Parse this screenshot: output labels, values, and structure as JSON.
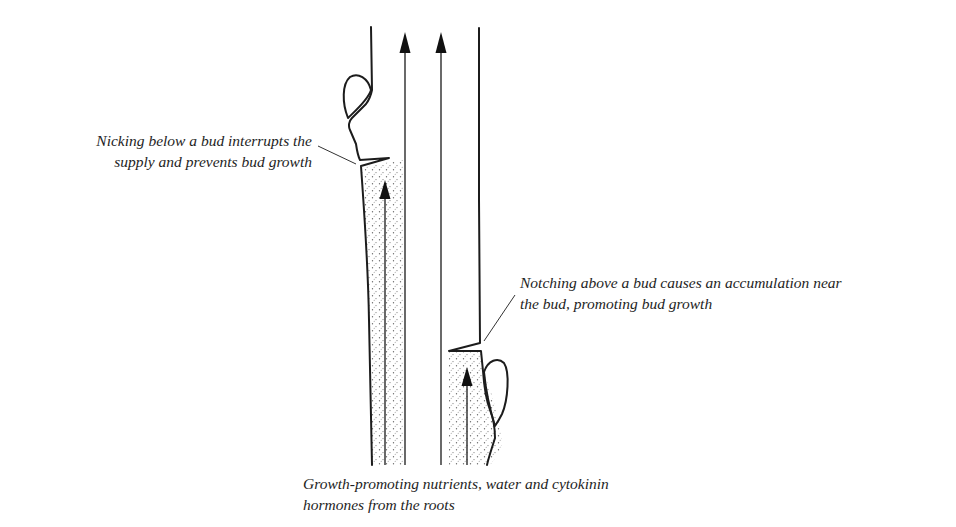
{
  "diagram": {
    "type": "botanical-illustration",
    "colors": {
      "ink": "#1c1c1c",
      "stipple": "#555555",
      "background": "#ffffff"
    },
    "labels": {
      "nicking": {
        "line1": "Nicking below a bud interrupts the",
        "line2": "supply and prevents bud growth"
      },
      "notching": {
        "line1": "Notching above a bud causes an accumulation near",
        "line2": "the bud, promoting bud growth"
      },
      "roots": {
        "line1": "Growth-promoting nutrients, water and cytokinin",
        "line2": "hormones from the roots"
      }
    },
    "elements": [
      {
        "name": "upper-bud",
        "side": "left",
        "state": "suppressed (above nick)"
      },
      {
        "name": "lower-bud",
        "side": "right",
        "state": "promoted (below notch)"
      },
      {
        "name": "nick-cut",
        "position": "below upper bud"
      },
      {
        "name": "notch-cut",
        "position": "above lower bud"
      },
      {
        "name": "flow-arrows",
        "count": 4,
        "direction": "upward"
      }
    ]
  }
}
